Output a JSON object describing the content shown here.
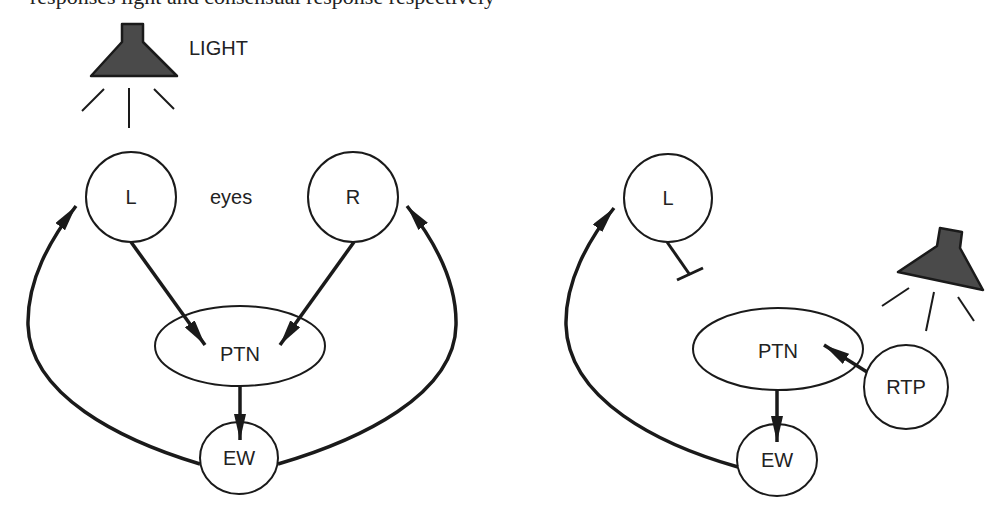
{
  "figure": {
    "top_cut_text": "responses light and consensual response respectively",
    "left_panel": {
      "light_label": "LIGHT",
      "eyes_label": "eyes",
      "nodes": {
        "left_eye": "L",
        "right_eye": "R",
        "ptn": "PTN",
        "ew": "EW"
      }
    },
    "right_panel": {
      "nodes": {
        "left_eye": "L",
        "ptn": "PTN",
        "rtp": "RTP",
        "ew": "EW"
      }
    },
    "colors": {
      "line": "#1a1a1a",
      "lamp_fill": "#4a4a4a",
      "background": "#ffffff"
    }
  }
}
